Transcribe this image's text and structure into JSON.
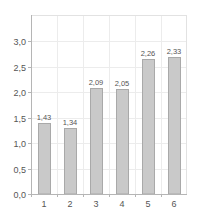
{
  "chart_data": {
    "type": "bar",
    "title": "",
    "xlabel": "",
    "ylabel": "",
    "categories": [
      "1",
      "2",
      "3",
      "4",
      "5",
      "6"
    ],
    "values": [
      1.39,
      1.29,
      2.08,
      2.06,
      2.65,
      2.69
    ],
    "data_labels": [
      "1,43",
      "1,34",
      "2,09",
      "2,05",
      "2,26",
      "2,33"
    ],
    "ylim": [
      0,
      3.4
    ],
    "yticks": [
      0.0,
      0.5,
      1.0,
      1.5,
      2.0,
      2.5,
      3.0
    ],
    "ytick_labels": [
      "0,0",
      "0,5",
      "1,0",
      "1,5",
      "2,0",
      "2,5",
      "3,0"
    ],
    "grid": true,
    "legend": null,
    "colors": {
      "bar_fill": "#c9c9c9",
      "bar_stroke": "#a9a9a9",
      "grid": "#ececec",
      "axis": "#b5b5b5",
      "text": "#555555"
    }
  }
}
